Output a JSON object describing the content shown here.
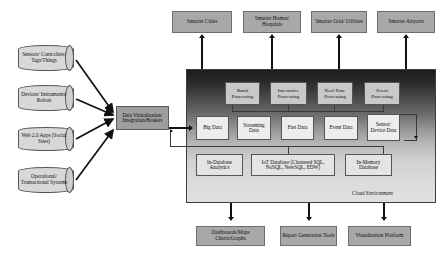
{
  "diagram": {
    "cloud_label": "Cloud Environment"
  },
  "sources": {
    "heading": "Data Sources",
    "items": [
      {
        "label": "Sensors/ Controllers/ Tags/Things"
      },
      {
        "label": "Devices/ Instruments/ Robots"
      },
      {
        "label": "Web 2.0 Apps (Social Sites)"
      },
      {
        "label": "Operational/ Transactional Systems"
      }
    ]
  },
  "integration": {
    "label": "Data Virtualization/ Integration/Brokers"
  },
  "consumers": {
    "items": [
      {
        "label": "Smarter Cities"
      },
      {
        "label": "Smarter Homes/ Hospitals"
      },
      {
        "label": "Smarter Grid/ Utilities"
      },
      {
        "label": "Smarter Airports"
      }
    ]
  },
  "processing": {
    "items": [
      {
        "label": "Batch Processing"
      },
      {
        "label": "Interactive Processing"
      },
      {
        "label": "Real Time Processing"
      },
      {
        "label": "Event Processing"
      }
    ]
  },
  "data_types": {
    "items": [
      {
        "label": "Big Data"
      },
      {
        "label": "Streaming Data"
      },
      {
        "label": "Fast Data"
      },
      {
        "label": "Event Data"
      },
      {
        "label": "Sensor/ Device Data"
      }
    ]
  },
  "databases": {
    "items": [
      {
        "label": "In-Database Analytics"
      },
      {
        "label": "IoT Database (Clustered SQL, NoSQL, NewSQL, EDW)"
      },
      {
        "label": "In-Memory Database"
      }
    ]
  },
  "outputs": {
    "items": [
      {
        "label": "Dashboards/Maps Charts/Graphs"
      },
      {
        "label": "Report Generation Tools"
      },
      {
        "label": "Visualization Platform"
      }
    ]
  },
  "colors": {
    "gray_box": "#a8a8a8",
    "cylinder": "#d8d8d8",
    "integration": "#9e9e9e",
    "processing": "#c9c9c9",
    "data": "#ededed",
    "database": "#e4e4e4",
    "cloud_top": "#1c1c1c",
    "cloud_bottom": "#e0e0e0",
    "line": "#111111"
  }
}
